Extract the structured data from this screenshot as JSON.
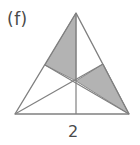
{
  "figure": {
    "part_label": "(f)",
    "base_length_label": "2",
    "colors": {
      "background": "#ffffff",
      "stroke": "#808080",
      "shade_fill": "#b3b3b3",
      "label_text": "#4a4a4a"
    },
    "geometry": {
      "apex": [
        76,
        13
      ],
      "left_vertex": [
        15,
        114
      ],
      "right_vertex": [
        129,
        114
      ],
      "base_midpoint": [
        76,
        114
      ],
      "left_side_midpoint": [
        45,
        65
      ],
      "right_side_midpoint": [
        103,
        64
      ],
      "centroid": [
        76,
        81
      ]
    },
    "outline_points": "76,13 129,114 15,114",
    "median_from_apex": "76,13 76,114",
    "median_from_left_vertex": "15,114 103,64",
    "median_from_right_vertex": "129,114 45,65",
    "shaded_region_upper_left": "76,13 76,81 45,65",
    "shaded_region_right": "76,81 103,64 129,114",
    "shaded_region_count": 2
  }
}
